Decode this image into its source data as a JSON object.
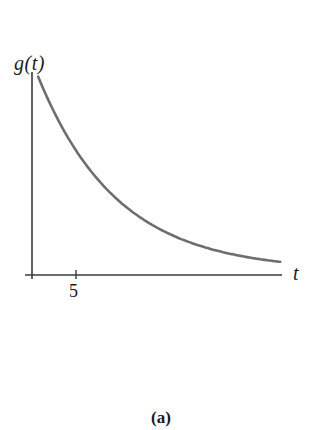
{
  "figure": {
    "caption": "(a)",
    "y_axis_label": "g(t)",
    "x_axis_label": "t",
    "x_tick_labels": [
      "5"
    ],
    "colors": {
      "axis": "#3a3a3a",
      "curve": "#6e6e6e",
      "text": "#1a1a1a",
      "background": "#ffffff"
    }
  },
  "chart_data": {
    "type": "line",
    "title": "",
    "caption": "(a)",
    "xlabel": "t",
    "ylabel": "g(t)",
    "x_ticks": [
      5
    ],
    "y_ticks": [],
    "grid": false,
    "legend": null,
    "series": [
      {
        "name": "g(t)",
        "x": [
          0.7,
          3,
          5,
          7,
          9,
          11,
          13,
          15,
          18,
          21,
          24,
          28
        ],
        "values": [
          195,
          151,
          132,
          98,
          70,
          53,
          41,
          32,
          22,
          15,
          10,
          7
        ]
      }
    ],
    "xlim": [
      0,
      28.5
    ],
    "ylim": [
      0,
      205
    ]
  }
}
